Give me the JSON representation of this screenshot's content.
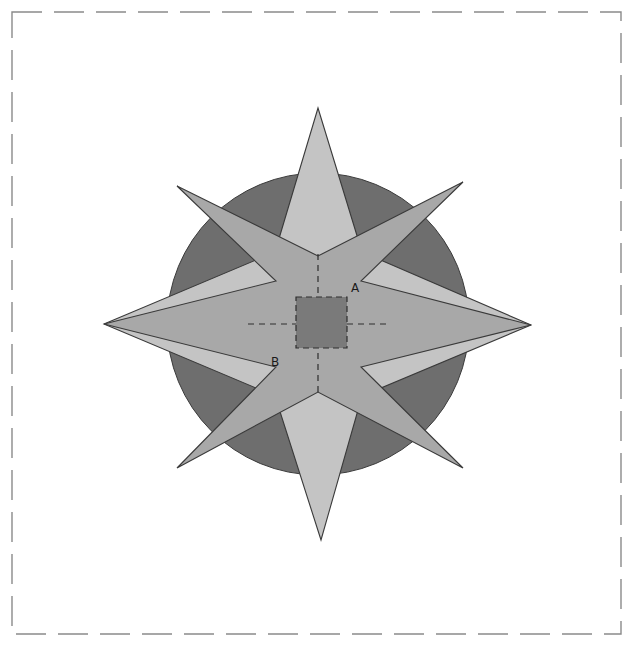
{
  "canvas": {
    "width": 633,
    "height": 646,
    "background": "#ffffff"
  },
  "border": {
    "name": "dashed-frame",
    "stroke": "#8a8a8a",
    "stroke_width": 1.4,
    "dash": "30 12",
    "x": 12,
    "y": 12,
    "width": 609,
    "height": 622
  },
  "palette": {
    "circle_fill": "#6e6e6e",
    "star_major_fill": "#a8a8a8",
    "star_minor_fill": "#c4c4c4",
    "square_fill": "#7a7a7a",
    "outline": "#3a3a3a",
    "dash_guide": "#2e2e2e",
    "label_color": "#1a1a1a"
  },
  "figure": {
    "name": "eight-point-star-over-circle",
    "center": {
      "x": 318,
      "y": 324
    },
    "circle": {
      "name": "background-circle",
      "cx": 318,
      "cy": 324,
      "r": 151,
      "fill": "#6e6e6e"
    },
    "star_major": {
      "name": "four-point-major-star",
      "fill": "#a8a8a8",
      "inner_radius": 72,
      "outer_radius": 200,
      "points_deg": [
        45,
        135,
        225,
        315
      ],
      "polygon": "463,182 361,281 531,325 361,367 463,468 318,392 177,468 276,367 104,324 276,281 177,186 318,256"
    },
    "star_minor": {
      "name": "four-point-minor-star",
      "fill": "#c4c4c4",
      "inner_radius": 72,
      "outer_radius": 216,
      "points_deg": [
        0,
        90,
        180,
        270
      ],
      "polygon": "318,108 362,252 531,325 362,396 321,540 275,396 104,324 275,252"
    },
    "square": {
      "name": "center-square",
      "x": 296,
      "y": 297,
      "width": 51,
      "height": 51,
      "fill": "#7a7a7a"
    },
    "guides": [
      {
        "name": "guide-vertical",
        "x1": 318,
        "y1": 256,
        "x2": 318,
        "y2": 392
      },
      {
        "name": "guide-horizontal",
        "x1": 250,
        "y1": 324,
        "x2": 386,
        "y2": 324
      }
    ]
  },
  "labels": [
    {
      "id": "A",
      "text": "A",
      "x": 355,
      "y": 288,
      "name": "vertex-label-a"
    },
    {
      "id": "B",
      "text": "B",
      "x": 275,
      "y": 362,
      "name": "vertex-label-b"
    }
  ],
  "chart_data": {
    "type": "diagram",
    "title": "",
    "annotations": [
      "A",
      "B"
    ]
  }
}
